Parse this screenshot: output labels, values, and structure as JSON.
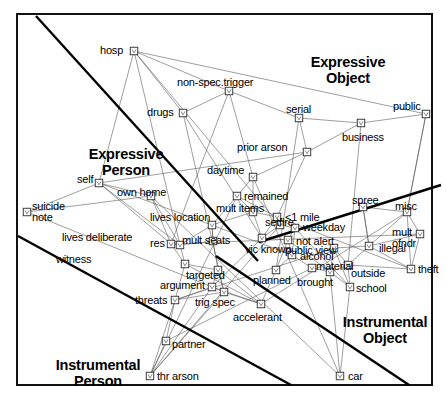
{
  "chart_data": {
    "type": "scatter",
    "title": "",
    "subtitle": "",
    "xlabel": "",
    "ylabel": "",
    "grid": false,
    "legend_position": "none",
    "axis_ranges": {
      "x": [
        0,
        447
      ],
      "y": [
        0,
        401
      ]
    },
    "region_labels": [
      {
        "name": "expressive-person",
        "text": "Expressive\nPerson",
        "x": 126,
        "y": 146
      },
      {
        "name": "expressive-object",
        "text": "Expressive\nObject",
        "x": 348,
        "y": 54
      },
      {
        "name": "instrumental-person",
        "text": "Instrumental\nPerson",
        "x": 98,
        "y": 357
      },
      {
        "name": "instrumental-object",
        "text": "Instrumental\nObject",
        "x": 385,
        "y": 314
      }
    ],
    "points": [
      {
        "label": "hosp",
        "mx": 134,
        "my": 51,
        "lx": 100,
        "ly": 45,
        "align": "right"
      },
      {
        "label": "non-spec.trigger",
        "mx": 229,
        "my": 91,
        "lx": 177,
        "ly": 77,
        "align": "left"
      },
      {
        "label": "drugs",
        "mx": 183,
        "my": 113,
        "lx": 147,
        "ly": 107,
        "align": "right"
      },
      {
        "label": "serial",
        "mx": 299,
        "my": 118,
        "lx": 286,
        "ly": 104,
        "align": "left"
      },
      {
        "label": "public",
        "mx": 426,
        "my": 114,
        "lx": 393,
        "ly": 101,
        "align": "left"
      },
      {
        "label": "business",
        "mx": 361,
        "my": 123,
        "lx": 342,
        "ly": 132,
        "align": "left"
      },
      {
        "label": "prior arson",
        "mx": 307,
        "my": 152,
        "lx": 237,
        "ly": 142,
        "align": "left"
      },
      {
        "label": "daytime",
        "mx": 253,
        "my": 177,
        "lx": 207,
        "ly": 165,
        "align": "left"
      },
      {
        "label": "remained",
        "mx": 237,
        "my": 196,
        "lx": 244,
        "ly": 191,
        "align": "left"
      },
      {
        "label": "self",
        "mx": 99,
        "my": 183,
        "lx": 77,
        "ly": 174,
        "align": "left"
      },
      {
        "label": "own home",
        "mx": 151,
        "my": 196,
        "lx": 117,
        "ly": 187,
        "align": "left"
      },
      {
        "label": "mult items",
        "mx": 253,
        "my": 212,
        "lx": 216,
        "ly": 203,
        "align": "left"
      },
      {
        "label": "spree",
        "mx": 363,
        "my": 207,
        "lx": 352,
        "ly": 195,
        "align": "left"
      },
      {
        "label": "misc",
        "mx": 407,
        "my": 212,
        "lx": 395,
        "ly": 201,
        "align": "left"
      },
      {
        "label": "suicide\nnote",
        "mx": 27,
        "my": 212,
        "lx": 32,
        "ly": 201,
        "align": "left"
      },
      {
        "label": "lives location",
        "mx": 212,
        "my": 225,
        "lx": 150,
        "ly": 212,
        "align": "left"
      },
      {
        "label": "setfire",
        "mx": 280,
        "my": 225,
        "lx": 265,
        "ly": 217,
        "align": "left"
      },
      {
        "label": "<1 mile",
        "mx": 277,
        "my": 217,
        "lx": 285,
        "ly": 212,
        "align": "left"
      },
      {
        "label": "weekday",
        "mx": 295,
        "my": 228,
        "lx": 303,
        "ly": 222,
        "align": "left"
      },
      {
        "label": "not alert",
        "mx": 288,
        "my": 240,
        "lx": 296,
        "ly": 236,
        "align": "left"
      },
      {
        "label": "lives deliberate",
        "mx": 180,
        "my": 245,
        "lx": 62,
        "ly": 232,
        "align": "left"
      },
      {
        "label": "res",
        "mx": 171,
        "my": 244,
        "lx": 150,
        "ly": 238,
        "align": "left"
      },
      {
        "label": "mult seats",
        "mx": 213,
        "my": 241,
        "lx": 182,
        "ly": 235,
        "align": "left"
      },
      {
        "label": "vic known",
        "mx": 262,
        "my": 238,
        "lx": 245,
        "ly": 244,
        "align": "left"
      },
      {
        "label": "mult\nofndr",
        "mx": 420,
        "my": 234,
        "lx": 392,
        "ly": 227,
        "align": "left"
      },
      {
        "label": "public view",
        "mx": 334,
        "my": 248,
        "lx": 285,
        "ly": 245,
        "align": "left"
      },
      {
        "label": "illegal",
        "mx": 369,
        "my": 246,
        "lx": 379,
        "ly": 243,
        "align": "left"
      },
      {
        "label": "alcohol",
        "mx": 292,
        "my": 255,
        "lx": 300,
        "ly": 251,
        "align": "left"
      },
      {
        "label": "witness",
        "mx": 185,
        "my": 264,
        "lx": 56,
        "ly": 254,
        "align": "left"
      },
      {
        "label": "material",
        "mx": 312,
        "my": 268,
        "lx": 316,
        "ly": 261,
        "align": "left"
      },
      {
        "label": "outside",
        "mx": 348,
        "my": 265,
        "lx": 351,
        "ly": 268,
        "align": "left"
      },
      {
        "label": "theft",
        "mx": 411,
        "my": 269,
        "lx": 418,
        "ly": 264,
        "align": "left"
      },
      {
        "label": "targeted",
        "mx": 218,
        "my": 270,
        "lx": 186,
        "ly": 270,
        "align": "left"
      },
      {
        "label": "planned",
        "mx": 276,
        "my": 270,
        "lx": 253,
        "ly": 275,
        "align": "left"
      },
      {
        "label": "brought",
        "mx": 330,
        "my": 272,
        "lx": 297,
        "ly": 277,
        "align": "left"
      },
      {
        "label": "school",
        "mx": 350,
        "my": 287,
        "lx": 356,
        "ly": 283,
        "align": "left"
      },
      {
        "label": "argument",
        "mx": 212,
        "my": 287,
        "lx": 160,
        "ly": 280,
        "align": "left"
      },
      {
        "label": "threats",
        "mx": 175,
        "my": 300,
        "lx": 135,
        "ly": 295,
        "align": "left"
      },
      {
        "label": "trig spec",
        "mx": 224,
        "my": 292,
        "lx": 195,
        "ly": 297,
        "align": "left"
      },
      {
        "label": "accelerant",
        "mx": 261,
        "my": 304,
        "lx": 233,
        "ly": 312,
        "align": "left"
      },
      {
        "label": "partner",
        "mx": 166,
        "my": 341,
        "lx": 172,
        "ly": 339,
        "align": "left"
      },
      {
        "label": "thr arson",
        "mx": 150,
        "my": 376,
        "lx": 157,
        "ly": 371,
        "align": "left"
      },
      {
        "label": "car",
        "mx": 340,
        "my": 376,
        "lx": 348,
        "ly": 371,
        "align": "left"
      }
    ],
    "partition_lines": [
      {
        "name": "expressive-person-object-divider",
        "x1": 36,
        "y1": 16,
        "x2": 258,
        "y2": 261
      },
      {
        "name": "expressive-instrumental-divider",
        "x1": 18,
        "y1": 236,
        "x2": 291,
        "y2": 385
      },
      {
        "name": "instrumental-object-divider",
        "x1": 216,
        "y1": 256,
        "x2": 409,
        "y2": 385
      },
      {
        "name": "object-right-divider",
        "x1": 259,
        "y1": 242,
        "x2": 441,
        "y2": 185
      }
    ],
    "frame": {
      "x": 17,
      "y": 14,
      "w": 415,
      "h": 371
    }
  }
}
